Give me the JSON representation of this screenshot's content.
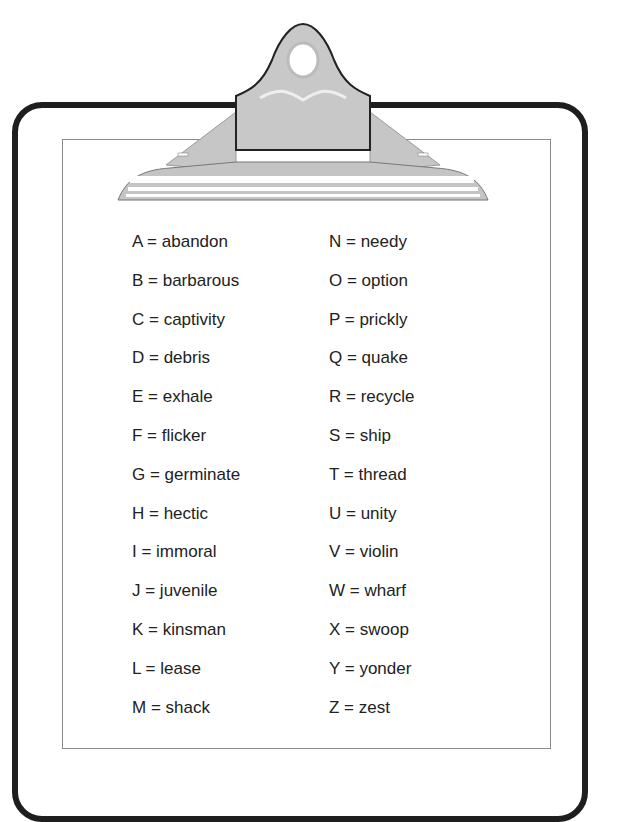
{
  "document": {
    "title": "Clipboard word key",
    "left_column": [
      {
        "letter": "A",
        "text": "A = abandon"
      },
      {
        "letter": "B",
        "text": "B = barbarous"
      },
      {
        "letter": "C",
        "text": "C = captivity"
      },
      {
        "letter": "D",
        "text": "D = debris"
      },
      {
        "letter": "E",
        "text": "E = exhale"
      },
      {
        "letter": "F",
        "text": "F = flicker"
      },
      {
        "letter": "G",
        "text": "G = germinate"
      },
      {
        "letter": "H",
        "text": "H = hectic"
      },
      {
        "letter": "I",
        "text": "I = immoral"
      },
      {
        "letter": "J",
        "text": "J = juvenile"
      },
      {
        "letter": "K",
        "text": "K = kinsman"
      },
      {
        "letter": "L",
        "text": "L = lease"
      },
      {
        "letter": "M",
        "text": "M = shack"
      }
    ],
    "right_column": [
      {
        "letter": "N",
        "text": "N = needy"
      },
      {
        "letter": "O",
        "text": "O = option"
      },
      {
        "letter": "P",
        "text": "P = prickly"
      },
      {
        "letter": "Q",
        "text": "Q = quake"
      },
      {
        "letter": "R",
        "text": "R = recycle"
      },
      {
        "letter": "S",
        "text": "S = ship"
      },
      {
        "letter": "T",
        "text": "T = thread"
      },
      {
        "letter": "U",
        "text": "U = unity"
      },
      {
        "letter": "V",
        "text": "V = violin"
      },
      {
        "letter": "W",
        "text": "W = wharf"
      },
      {
        "letter": "X",
        "text": "X = swoop"
      },
      {
        "letter": "Y",
        "text": "Y = yonder"
      },
      {
        "letter": "Z",
        "text": "Z = zest"
      }
    ]
  },
  "colors": {
    "board_outline": "#1e1e1e",
    "clip_metal": "#c4c4c4",
    "paper_border": "#8a8a8a",
    "text": "#222222"
  },
  "icons": {
    "clip": "clipboard-clip-icon"
  }
}
